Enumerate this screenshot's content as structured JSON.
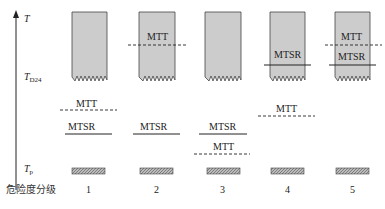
{
  "axis": {
    "label_top": "T",
    "label_mid": "T",
    "label_mid_sub": "D24",
    "label_bottom": "T",
    "label_bottom_sub": "p",
    "category_title": "危险度分级"
  },
  "levels": [
    {
      "id": "1",
      "label": "1",
      "box_text": [],
      "mtt_label": "MTT",
      "mtsr_label": "MTSR"
    },
    {
      "id": "2",
      "label": "2",
      "box_text": [
        "MTT"
      ],
      "mtt_label": "MTT",
      "mtsr_label": "MTSR"
    },
    {
      "id": "3",
      "label": "3",
      "box_text": [],
      "mtt_label": "MTT",
      "mtsr_label": "MTSR"
    },
    {
      "id": "4",
      "label": "4",
      "box_text": [
        "MTSR"
      ],
      "mtt_label": "MTT",
      "mtsr_label": "MTSR"
    },
    {
      "id": "5",
      "label": "5",
      "box_text": [
        "MTT",
        "MTSR"
      ],
      "mtt_label": "MTT",
      "mtsr_label": "MTSR"
    }
  ],
  "colors": {
    "box_fill": "#cccccc",
    "box_stroke": "#444444",
    "line": "#222222"
  }
}
